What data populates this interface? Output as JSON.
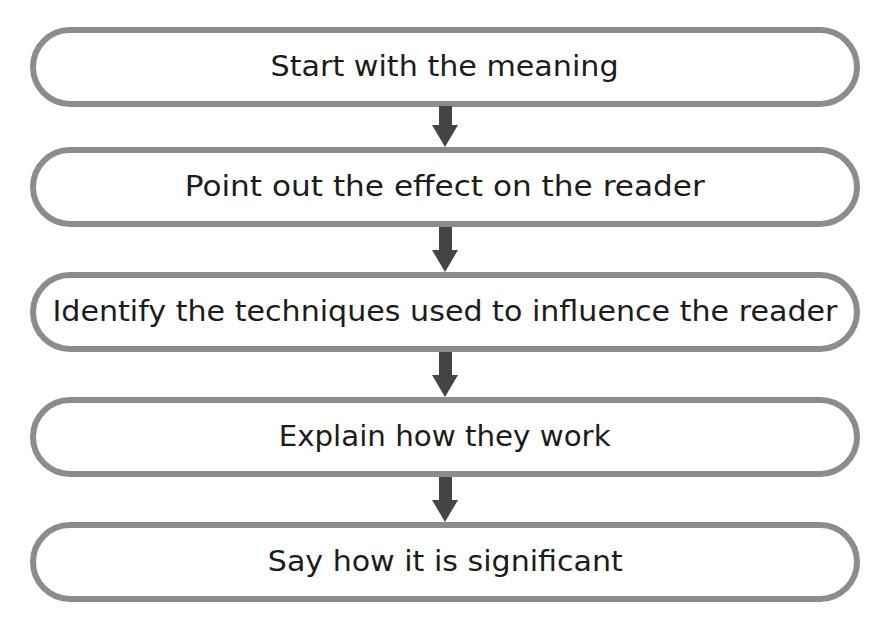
{
  "flowchart": {
    "steps": [
      {
        "label": "Start with the meaning",
        "top": 27,
        "text_width": 348
      },
      {
        "label": "Point out the effect on the reader",
        "top": 147,
        "text_width": 520
      },
      {
        "label": "Identify the techniques used to influence the reader",
        "top": 272,
        "text_width": 785
      },
      {
        "label": "Explain how they work",
        "top": 397,
        "text_width": 332
      },
      {
        "label": "Say how it is significant",
        "top": 522,
        "text_width": 355
      }
    ],
    "arrows": [
      {
        "icon": "down-arrow-icon",
        "top": 106,
        "height": 41
      },
      {
        "icon": "down-arrow-icon",
        "top": 227,
        "height": 45
      },
      {
        "icon": "down-arrow-icon",
        "top": 352,
        "height": 45
      },
      {
        "icon": "down-arrow-icon",
        "top": 477,
        "height": 45
      }
    ],
    "colors": {
      "border": "#8c8c8c",
      "arrow": "#454545",
      "text": "#1c1c1c"
    }
  }
}
